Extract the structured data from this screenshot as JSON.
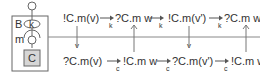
{
  "component": {
    "outer_label": "B",
    "port_label": "k",
    "connector_label": "m",
    "inner_label": "C",
    "inner_fill": "#d6d6d6"
  },
  "top_row": {
    "terms": [
      "!C.m(v)",
      "?C.m w",
      "!C.m(v')",
      "?C.m w'"
    ],
    "arrow_subscripts": [
      "k",
      "k",
      "k"
    ]
  },
  "bottom_row": {
    "terms": [
      "?C.m(v)",
      "!C.m w",
      "?C.m(v')",
      "!C.m w'"
    ],
    "arrow_subscripts": [
      "c",
      "c",
      "c"
    ]
  },
  "vertical_links": {
    "down_labels": [
      "v",
      "v"
    ],
    "up_arrows": 2
  },
  "colors": {
    "line": "#555555",
    "text": "#333333"
  }
}
